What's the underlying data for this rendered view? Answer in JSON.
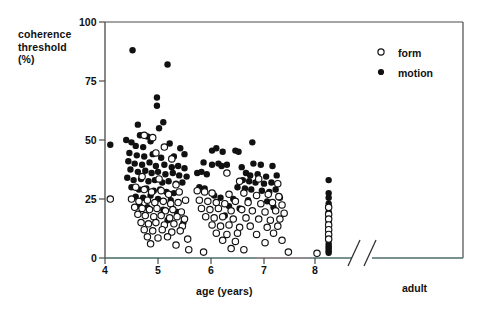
{
  "chart_data": {
    "type": "scatter",
    "title": "",
    "xlabel": "age (years)",
    "ylabel": "coherence threshold (%)",
    "ylabel_lines": [
      "coherence",
      "threshold",
      "(%)"
    ],
    "xlim": [
      4,
      8.4
    ],
    "ylim": [
      0,
      100
    ],
    "yticks": [
      0,
      25,
      50,
      75,
      100
    ],
    "ytick_labels": [
      "0",
      "25",
      "50",
      "75",
      "100"
    ],
    "xticks": [
      4,
      5,
      6,
      7,
      8
    ],
    "xtick_labels": [
      "4",
      "5",
      "6",
      "7",
      "8"
    ],
    "grid": false,
    "axis_break": true,
    "axis_break_label": "adult",
    "legend_position": "top-right",
    "legend": [
      {
        "name": "form",
        "marker": "open-circle"
      },
      {
        "name": "motion",
        "marker": "filled-circle"
      }
    ],
    "series": [
      {
        "name": "motion",
        "marker": "filled-circle",
        "color": "#111111",
        "points": [
          [
            4.1,
            48.0
          ],
          [
            4.52,
            88.0
          ],
          [
            5.18,
            82.0
          ],
          [
            4.98,
            68.0
          ],
          [
            4.98,
            64.5
          ],
          [
            4.62,
            56.5
          ],
          [
            4.66,
            52.0
          ],
          [
            4.8,
            51.5
          ],
          [
            5.02,
            55.0
          ],
          [
            5.1,
            57.5
          ],
          [
            4.4,
            50.0
          ],
          [
            4.5,
            49.0
          ],
          [
            4.58,
            47.5
          ],
          [
            4.72,
            47.0
          ],
          [
            4.86,
            49.5
          ],
          [
            5.22,
            48.5
          ],
          [
            5.42,
            46.5
          ],
          [
            5.5,
            44.0
          ],
          [
            4.46,
            44.5
          ],
          [
            4.6,
            43.5
          ],
          [
            4.74,
            43.0
          ],
          [
            4.9,
            44.0
          ],
          [
            5.06,
            42.5
          ],
          [
            5.3,
            43.0
          ],
          [
            4.44,
            41.0
          ],
          [
            4.56,
            40.0
          ],
          [
            4.7,
            39.5
          ],
          [
            4.84,
            40.5
          ],
          [
            4.96,
            39.0
          ],
          [
            5.12,
            39.5
          ],
          [
            5.26,
            38.5
          ],
          [
            5.38,
            39.0
          ],
          [
            5.5,
            38.0
          ],
          [
            4.48,
            37.5
          ],
          [
            4.62,
            36.5
          ],
          [
            4.76,
            37.0
          ],
          [
            4.88,
            36.0
          ],
          [
            5.0,
            36.5
          ],
          [
            5.14,
            35.5
          ],
          [
            5.28,
            36.0
          ],
          [
            5.4,
            35.0
          ],
          [
            5.54,
            34.5
          ],
          [
            4.42,
            34.0
          ],
          [
            4.54,
            33.0
          ],
          [
            4.68,
            33.5
          ],
          [
            4.82,
            32.5
          ],
          [
            4.94,
            33.0
          ],
          [
            5.08,
            32.0
          ],
          [
            5.2,
            32.5
          ],
          [
            5.34,
            31.5
          ],
          [
            5.46,
            32.0
          ],
          [
            4.5,
            30.0
          ],
          [
            4.64,
            29.0
          ],
          [
            4.78,
            29.5
          ],
          [
            4.92,
            28.5
          ],
          [
            5.04,
            29.0
          ],
          [
            5.16,
            28.0
          ],
          [
            5.3,
            27.5
          ],
          [
            4.58,
            26.0
          ],
          [
            4.72,
            25.5
          ],
          [
            4.86,
            26.5
          ],
          [
            5.0,
            25.0
          ],
          [
            5.24,
            24.5
          ],
          [
            4.66,
            22.0
          ],
          [
            4.8,
            21.5
          ],
          [
            5.1,
            20.5
          ],
          [
            5.36,
            19.5
          ],
          [
            5.18,
            16.0
          ],
          [
            5.48,
            15.0
          ],
          [
            6.02,
            45.5
          ],
          [
            6.1,
            46.5
          ],
          [
            6.22,
            45.0
          ],
          [
            6.46,
            45.5
          ],
          [
            6.52,
            45.0
          ],
          [
            6.78,
            49.0
          ],
          [
            5.86,
            40.5
          ],
          [
            6.02,
            39.5
          ],
          [
            6.14,
            40.0
          ],
          [
            6.2,
            39.0
          ],
          [
            6.3,
            39.5
          ],
          [
            6.58,
            38.5
          ],
          [
            6.8,
            40.0
          ],
          [
            6.94,
            39.5
          ],
          [
            7.16,
            39.0
          ],
          [
            5.74,
            36.0
          ],
          [
            5.82,
            36.5
          ],
          [
            5.92,
            35.5
          ],
          [
            6.66,
            36.0
          ],
          [
            6.74,
            35.0
          ],
          [
            6.88,
            35.5
          ],
          [
            7.04,
            34.5
          ],
          [
            7.24,
            35.0
          ],
          [
            6.6,
            33.0
          ],
          [
            6.72,
            32.5
          ],
          [
            6.84,
            32.0
          ],
          [
            7.0,
            31.5
          ],
          [
            7.14,
            32.0
          ],
          [
            6.5,
            30.0
          ],
          [
            6.64,
            29.5
          ],
          [
            6.76,
            29.0
          ],
          [
            6.96,
            28.5
          ],
          [
            7.1,
            28.0
          ],
          [
            7.22,
            29.0
          ],
          [
            5.78,
            30.0
          ],
          [
            5.88,
            29.5
          ],
          [
            6.06,
            26.5
          ],
          [
            6.18,
            25.5
          ],
          [
            6.42,
            25.0
          ],
          [
            6.7,
            24.5
          ],
          [
            7.06,
            24.0
          ],
          [
            7.3,
            25.5
          ],
          [
            6.34,
            22.0
          ],
          [
            6.54,
            21.0
          ],
          [
            7.18,
            21.5
          ],
          [
            6.26,
            18.0
          ],
          [
            8.22,
            33.0
          ],
          [
            8.22,
            27.5
          ],
          [
            8.22,
            25.5
          ],
          [
            8.22,
            23.0
          ],
          [
            8.22,
            19.5
          ],
          [
            8.22,
            17.5
          ],
          [
            8.22,
            15.5
          ],
          [
            8.22,
            13.0
          ],
          [
            8.22,
            11.0
          ],
          [
            8.22,
            9.0
          ],
          [
            8.22,
            7.5
          ],
          [
            8.22,
            6.0
          ],
          [
            8.22,
            5.0
          ],
          [
            8.22,
            4.0
          ],
          [
            8.22,
            3.0
          ],
          [
            8.22,
            2.2
          ]
        ]
      },
      {
        "name": "form",
        "marker": "open-circle",
        "color": "#111111",
        "points": [
          [
            4.1,
            25.0
          ],
          [
            4.74,
            52.0
          ],
          [
            4.9,
            51.0
          ],
          [
            5.12,
            47.0
          ],
          [
            4.96,
            44.5
          ],
          [
            5.26,
            42.0
          ],
          [
            4.7,
            34.5
          ],
          [
            5.02,
            33.5
          ],
          [
            5.34,
            31.0
          ],
          [
            4.58,
            30.0
          ],
          [
            4.74,
            29.0
          ],
          [
            4.88,
            28.0
          ],
          [
            5.06,
            28.5
          ],
          [
            5.2,
            27.0
          ],
          [
            5.4,
            28.0
          ],
          [
            4.5,
            25.0
          ],
          [
            4.64,
            24.0
          ],
          [
            4.8,
            24.5
          ],
          [
            4.94,
            23.5
          ],
          [
            5.1,
            24.0
          ],
          [
            5.24,
            23.0
          ],
          [
            5.38,
            23.5
          ],
          [
            5.52,
            24.5
          ],
          [
            4.56,
            21.5
          ],
          [
            4.7,
            21.0
          ],
          [
            4.84,
            20.5
          ],
          [
            4.98,
            21.0
          ],
          [
            5.14,
            20.0
          ],
          [
            5.28,
            20.5
          ],
          [
            5.44,
            19.5
          ],
          [
            4.62,
            18.5
          ],
          [
            4.76,
            18.0
          ],
          [
            4.92,
            17.5
          ],
          [
            5.06,
            18.0
          ],
          [
            5.22,
            17.0
          ],
          [
            5.36,
            17.5
          ],
          [
            5.5,
            16.5
          ],
          [
            4.68,
            15.0
          ],
          [
            4.82,
            14.5
          ],
          [
            4.96,
            15.0
          ],
          [
            5.12,
            14.0
          ],
          [
            5.3,
            14.5
          ],
          [
            5.46,
            13.5
          ],
          [
            4.74,
            12.0
          ],
          [
            4.9,
            11.5
          ],
          [
            5.08,
            12.0
          ],
          [
            5.26,
            11.0
          ],
          [
            5.42,
            11.5
          ],
          [
            4.8,
            9.0
          ],
          [
            5.0,
            8.5
          ],
          [
            5.18,
            9.0
          ],
          [
            5.56,
            8.0
          ],
          [
            4.86,
            6.0
          ],
          [
            5.34,
            5.5
          ],
          [
            5.58,
            3.5
          ],
          [
            5.86,
            2.5
          ],
          [
            6.3,
            36.0
          ],
          [
            6.54,
            32.5
          ],
          [
            6.9,
            33.5
          ],
          [
            7.26,
            31.5
          ],
          [
            5.74,
            28.5
          ],
          [
            5.88,
            28.0
          ],
          [
            6.02,
            27.5
          ],
          [
            6.34,
            27.0
          ],
          [
            6.62,
            27.5
          ],
          [
            6.86,
            26.5
          ],
          [
            7.08,
            27.0
          ],
          [
            7.28,
            26.0
          ],
          [
            5.78,
            24.5
          ],
          [
            5.94,
            24.0
          ],
          [
            6.1,
            23.5
          ],
          [
            6.26,
            23.0
          ],
          [
            6.46,
            24.0
          ],
          [
            6.7,
            23.5
          ],
          [
            6.94,
            23.0
          ],
          [
            7.16,
            23.5
          ],
          [
            7.34,
            22.5
          ],
          [
            5.82,
            21.0
          ],
          [
            5.98,
            20.5
          ],
          [
            6.14,
            21.0
          ],
          [
            6.38,
            20.0
          ],
          [
            6.58,
            20.5
          ],
          [
            6.78,
            20.0
          ],
          [
            7.02,
            19.5
          ],
          [
            7.22,
            20.0
          ],
          [
            7.38,
            19.0
          ],
          [
            5.9,
            17.5
          ],
          [
            6.06,
            17.0
          ],
          [
            6.22,
            17.5
          ],
          [
            6.42,
            16.5
          ],
          [
            6.66,
            17.0
          ],
          [
            6.9,
            16.5
          ],
          [
            7.12,
            16.0
          ],
          [
            7.3,
            16.5
          ],
          [
            6.02,
            14.0
          ],
          [
            6.18,
            13.5
          ],
          [
            6.34,
            14.0
          ],
          [
            6.54,
            13.0
          ],
          [
            6.74,
            13.5
          ],
          [
            7.06,
            13.0
          ],
          [
            7.26,
            13.5
          ],
          [
            6.1,
            10.5
          ],
          [
            6.3,
            10.0
          ],
          [
            6.5,
            10.5
          ],
          [
            6.86,
            10.0
          ],
          [
            7.18,
            10.5
          ],
          [
            6.22,
            7.5
          ],
          [
            6.46,
            7.0
          ],
          [
            7.02,
            6.5
          ],
          [
            7.34,
            7.5
          ],
          [
            6.38,
            4.0
          ],
          [
            6.62,
            3.5
          ],
          [
            7.46,
            2.5
          ],
          [
            8.0,
            2.0
          ],
          [
            8.22,
            21.5
          ],
          [
            8.22,
            18.5
          ],
          [
            8.22,
            16.5
          ],
          [
            8.22,
            14.0
          ],
          [
            8.22,
            12.0
          ],
          [
            8.22,
            10.0
          ],
          [
            8.22,
            8.0
          ]
        ]
      }
    ]
  }
}
